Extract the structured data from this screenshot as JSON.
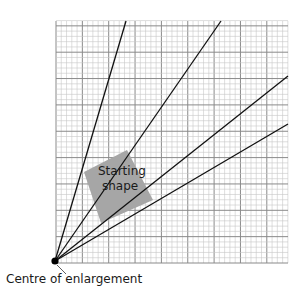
{
  "diagram": {
    "type": "enlargement-rays",
    "grid": {
      "x0": 56,
      "y0": 21,
      "x1": 288,
      "y1": 263,
      "minor": 5.27,
      "major_every": 5,
      "minor_color": "#c8c8c8",
      "major_color": "#8a8a8a"
    },
    "centre": {
      "x": 55,
      "y": 261,
      "label": "Centre of enlargement"
    },
    "rays": [
      {
        "x2": 126,
        "y2": 21
      },
      {
        "x2": 221,
        "y2": 21
      },
      {
        "x2": 288,
        "y2": 76
      },
      {
        "x2": 288,
        "y2": 124
      }
    ],
    "shape": {
      "label_line1": "Starting",
      "label_line2": "shape",
      "fill": "#a6a6a6",
      "points": "127,150 153,200 101,223 84,172"
    }
  }
}
